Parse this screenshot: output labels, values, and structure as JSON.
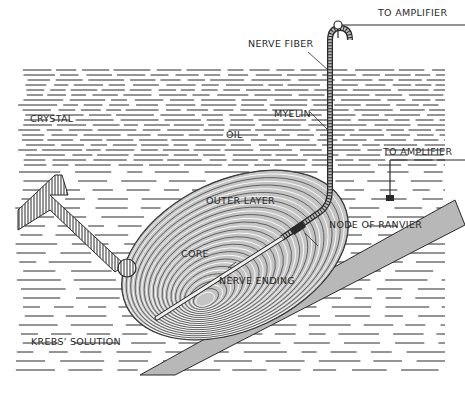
{
  "figure": {
    "colors": {
      "ink": "#2a2a2a",
      "corpuscle_fill": "#bdbdbd",
      "slide_fill": "#b8b8b8",
      "background": "#ffffff"
    },
    "labels": {
      "amplifier_top": "TO AMPLIFIER",
      "nerve_fiber": "NERVE FIBER",
      "crystal": "CRYSTAL",
      "oil": "OIL",
      "myelin": "MYELIN",
      "amplifier_mid": "TO AMPLIFIER",
      "outer_layer": "OUTER LAYER",
      "node_of_ranvier": "NODE OF RANVIER",
      "core": "CORE",
      "nerve_ending": "NERVE ENDING",
      "krebs_solution": "KREBS' SOLUTION"
    },
    "regions": [
      "oil-layer",
      "krebs-solution"
    ],
    "components": [
      "crystal",
      "corpuscle",
      "nerve-fiber",
      "electrode",
      "ground-electrode",
      "glass-slide"
    ]
  }
}
